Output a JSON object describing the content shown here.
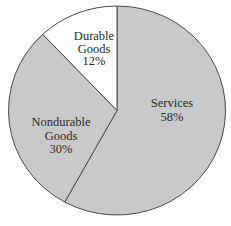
{
  "chart_data": {
    "type": "pie",
    "title": "",
    "categories": [
      "Services",
      "Nondurable Goods",
      "Durable Goods"
    ],
    "values": [
      58,
      30,
      12
    ],
    "unit": "%",
    "slices": [
      {
        "name": "Services",
        "label_lines": [
          "Services",
          "58%"
        ],
        "value": 58,
        "color": "#c9c9c9"
      },
      {
        "name": "Nondurable Goods",
        "label_lines": [
          "Nondurable",
          "Goods",
          "30%"
        ],
        "value": 30,
        "color": "#c9c9c9"
      },
      {
        "name": "Durable Goods",
        "label_lines": [
          "Durable",
          "Goods",
          "12%"
        ],
        "value": 12,
        "color": "#ffffff"
      }
    ],
    "legend": "none (labels inside slices)",
    "start_angle": "12 o'clock, clockwise"
  },
  "colors": {
    "slice_fill": "#c9c9c9",
    "highlight_fill": "#ffffff",
    "outline": "#4a4a4a",
    "text": "#2a2a2a"
  }
}
